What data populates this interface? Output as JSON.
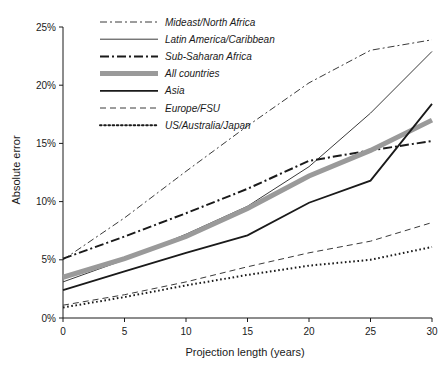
{
  "chart_data": {
    "type": "line",
    "title": "",
    "xlabel": "Projection length (years)",
    "ylabel": "Absolute error",
    "xlim": [
      0,
      30
    ],
    "ylim": [
      0,
      25
    ],
    "grid": false,
    "legend_position": "top-left",
    "x": [
      0,
      5,
      10,
      15,
      20,
      25,
      30
    ],
    "xticks": [
      "0",
      "5",
      "10",
      "15",
      "20",
      "25",
      "30"
    ],
    "yticks": [
      "0%",
      "5%",
      "10%",
      "15%",
      "20%",
      "25%"
    ],
    "ytick_values": [
      0,
      5,
      10,
      15,
      20,
      25
    ],
    "series": [
      {
        "name": "Mideast/North Africa",
        "style": "dash-dot-thin",
        "color": "#3a3a3a",
        "width": 1,
        "values": [
          5.0,
          8.6,
          12.6,
          16.5,
          20.2,
          23.0,
          23.9
        ]
      },
      {
        "name": "Latin America/Caribbean",
        "style": "solid-thin",
        "color": "#3a3a3a",
        "width": 1,
        "values": [
          3.1,
          5.0,
          7.2,
          9.6,
          13.0,
          17.6,
          22.9
        ]
      },
      {
        "name": "Sub-Saharan Africa",
        "style": "dash-dot-thick",
        "color": "#1a1a1a",
        "width": 2,
        "values": [
          5.1,
          7.0,
          9.0,
          11.1,
          13.5,
          14.4,
          15.2
        ]
      },
      {
        "name": "All countries",
        "style": "solid-gray-thick",
        "color": "#9a9a9a",
        "width": 5,
        "values": [
          3.5,
          5.1,
          7.0,
          9.4,
          12.2,
          14.4,
          17.0
        ]
      },
      {
        "name": "Asia",
        "style": "solid-black",
        "color": "#1a1a1a",
        "width": 1.8,
        "values": [
          2.4,
          4.0,
          5.6,
          7.1,
          9.9,
          11.8,
          18.4
        ]
      },
      {
        "name": "Europe/FSU",
        "style": "dashed-thin",
        "color": "#3a3a3a",
        "width": 1,
        "values": [
          1.1,
          2.0,
          3.1,
          4.4,
          5.6,
          6.6,
          8.2
        ]
      },
      {
        "name": "US/Australia/Japan",
        "style": "dotted-thick",
        "color": "#1a1a1a",
        "width": 2,
        "values": [
          0.9,
          1.8,
          2.8,
          3.7,
          4.5,
          5.0,
          6.1
        ]
      }
    ]
  },
  "legend": {
    "items": [
      {
        "label": "Mideast/North Africa"
      },
      {
        "label": "Latin America/Caribbean"
      },
      {
        "label": "Sub-Saharan Africa"
      },
      {
        "label": "All countries"
      },
      {
        "label": "Asia"
      },
      {
        "label": "Europe/FSU"
      },
      {
        "label": "US/Australia/Japan"
      }
    ]
  },
  "axes": {
    "x_title": "Projection length (years)",
    "y_title": "Absolute error"
  }
}
